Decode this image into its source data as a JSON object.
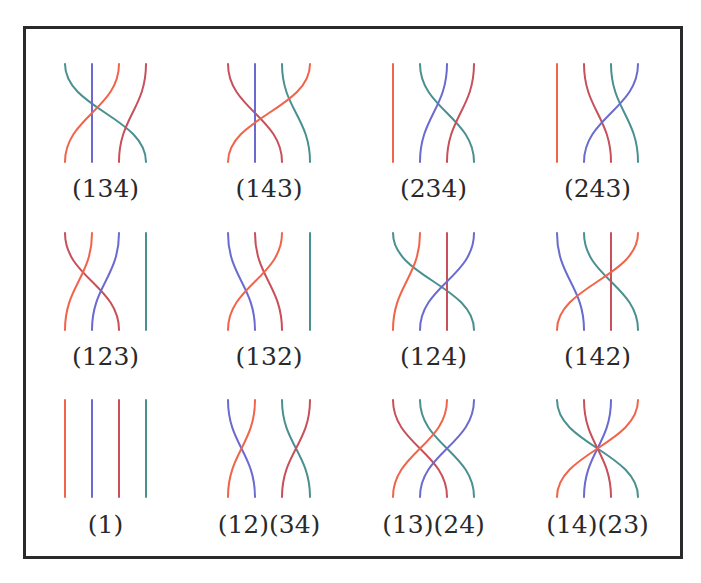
{
  "figure": {
    "frame": {
      "x": 23,
      "y": 26,
      "w": 658,
      "h": 531
    },
    "colors": {
      "orange": "#f0644a",
      "blue": "#6a6ad0",
      "crimson": "#c8505a",
      "teal": "#4a9090"
    },
    "rows": [
      {
        "top": 64,
        "bottom": 162,
        "label_y": 174
      },
      {
        "top": 233,
        "bottom": 330,
        "label_y": 342
      },
      {
        "top": 400,
        "bottom": 497,
        "label_y": 510
      }
    ],
    "columns": [
      {
        "xs": [
          65,
          92,
          119,
          146
        ]
      },
      {
        "xs": [
          228,
          255,
          282,
          310
        ]
      },
      {
        "xs": [
          393,
          420,
          447,
          474
        ]
      },
      {
        "xs": [
          557,
          584,
          611,
          638
        ]
      }
    ],
    "braids": [
      {
        "label": "(134)",
        "row": 0,
        "col": 0,
        "strands": [
          {
            "color": "teal",
            "from": 0,
            "to": 3
          },
          {
            "color": "blue",
            "from": 1,
            "to": 1
          },
          {
            "color": "orange",
            "from": 2,
            "to": 0
          },
          {
            "color": "crimson",
            "from": 3,
            "to": 2
          }
        ]
      },
      {
        "label": "(143)",
        "row": 0,
        "col": 1,
        "strands": [
          {
            "color": "crimson",
            "from": 0,
            "to": 2
          },
          {
            "color": "blue",
            "from": 1,
            "to": 1
          },
          {
            "color": "teal",
            "from": 2,
            "to": 3
          },
          {
            "color": "orange",
            "from": 3,
            "to": 0
          }
        ]
      },
      {
        "label": "(234)",
        "row": 0,
        "col": 2,
        "strands": [
          {
            "color": "orange",
            "from": 0,
            "to": 0
          },
          {
            "color": "teal",
            "from": 1,
            "to": 3
          },
          {
            "color": "blue",
            "from": 2,
            "to": 1
          },
          {
            "color": "crimson",
            "from": 3,
            "to": 2
          }
        ]
      },
      {
        "label": "(243)",
        "row": 0,
        "col": 3,
        "strands": [
          {
            "color": "orange",
            "from": 0,
            "to": 0
          },
          {
            "color": "crimson",
            "from": 1,
            "to": 2
          },
          {
            "color": "teal",
            "from": 2,
            "to": 3
          },
          {
            "color": "blue",
            "from": 3,
            "to": 1
          }
        ]
      },
      {
        "label": "(123)",
        "row": 1,
        "col": 0,
        "strands": [
          {
            "color": "crimson",
            "from": 0,
            "to": 2
          },
          {
            "color": "orange",
            "from": 1,
            "to": 0
          },
          {
            "color": "blue",
            "from": 2,
            "to": 1
          },
          {
            "color": "teal",
            "from": 3,
            "to": 3
          }
        ]
      },
      {
        "label": "(132)",
        "row": 1,
        "col": 1,
        "strands": [
          {
            "color": "blue",
            "from": 0,
            "to": 1
          },
          {
            "color": "crimson",
            "from": 1,
            "to": 2
          },
          {
            "color": "orange",
            "from": 2,
            "to": 0
          },
          {
            "color": "teal",
            "from": 3,
            "to": 3
          }
        ]
      },
      {
        "label": "(124)",
        "row": 1,
        "col": 2,
        "strands": [
          {
            "color": "teal",
            "from": 0,
            "to": 3
          },
          {
            "color": "orange",
            "from": 1,
            "to": 0
          },
          {
            "color": "crimson",
            "from": 2,
            "to": 2
          },
          {
            "color": "blue",
            "from": 3,
            "to": 1
          }
        ]
      },
      {
        "label": "(142)",
        "row": 1,
        "col": 3,
        "strands": [
          {
            "color": "blue",
            "from": 0,
            "to": 1
          },
          {
            "color": "teal",
            "from": 1,
            "to": 3
          },
          {
            "color": "crimson",
            "from": 2,
            "to": 2
          },
          {
            "color": "orange",
            "from": 3,
            "to": 0
          }
        ]
      },
      {
        "label": "(1)",
        "row": 2,
        "col": 0,
        "strands": [
          {
            "color": "orange",
            "from": 0,
            "to": 0
          },
          {
            "color": "blue",
            "from": 1,
            "to": 1
          },
          {
            "color": "crimson",
            "from": 2,
            "to": 2
          },
          {
            "color": "teal",
            "from": 3,
            "to": 3
          }
        ]
      },
      {
        "label": "(12)(34)",
        "row": 2,
        "col": 1,
        "strands": [
          {
            "color": "blue",
            "from": 0,
            "to": 1
          },
          {
            "color": "orange",
            "from": 1,
            "to": 0
          },
          {
            "color": "teal",
            "from": 2,
            "to": 3
          },
          {
            "color": "crimson",
            "from": 3,
            "to": 2
          }
        ]
      },
      {
        "label": "(13)(24)",
        "row": 2,
        "col": 2,
        "strands": [
          {
            "color": "crimson",
            "from": 0,
            "to": 2
          },
          {
            "color": "teal",
            "from": 1,
            "to": 3
          },
          {
            "color": "orange",
            "from": 2,
            "to": 0
          },
          {
            "color": "blue",
            "from": 3,
            "to": 1
          }
        ]
      },
      {
        "label": "(14)(23)",
        "row": 2,
        "col": 3,
        "strands": [
          {
            "color": "teal",
            "from": 0,
            "to": 3
          },
          {
            "color": "crimson",
            "from": 1,
            "to": 2
          },
          {
            "color": "blue",
            "from": 2,
            "to": 1
          },
          {
            "color": "orange",
            "from": 3,
            "to": 0
          }
        ]
      }
    ]
  }
}
